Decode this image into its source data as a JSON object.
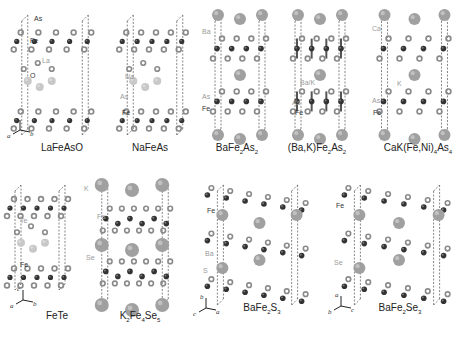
{
  "figure": {
    "colors": {
      "fe_atom": "#333333",
      "pnictogen_atom": "#8a8a8a",
      "large_cation": "#a0a0a0",
      "light_cation": "#c8c8c8",
      "cell_line": "#555555",
      "label_dark": "#333333",
      "label_light": "#9a9a9a"
    },
    "panels": [
      {
        "id": "lafeaso",
        "caption": "LaFeAsO",
        "caption_parts": [
          {
            "t": "LaFeAsO"
          }
        ],
        "element_labels": [
          "As",
          "Fe",
          "La",
          "O"
        ],
        "axes": {
          "c": "c",
          "a": "a",
          "b": "b"
        }
      },
      {
        "id": "nafeas",
        "caption": "NaFeAs",
        "caption_parts": [
          {
            "t": "NaFeAs"
          }
        ],
        "element_labels": [
          "Na",
          "As",
          "Fe"
        ]
      },
      {
        "id": "bafe2as2",
        "caption": "BaFe2As2",
        "caption_parts": [
          {
            "t": "BaFe"
          },
          {
            "sub": "2"
          },
          {
            "t": "As"
          },
          {
            "sub": "2"
          }
        ],
        "element_labels": [
          "Ba",
          "As",
          "Fe"
        ]
      },
      {
        "id": "bakfe2as2",
        "caption": "(Ba,K)Fe2As2",
        "caption_parts": [
          {
            "t": "(Ba,K)Fe"
          },
          {
            "sub": "2"
          },
          {
            "t": "As"
          },
          {
            "sub": "2"
          }
        ],
        "element_labels": [
          "Ba/K",
          "As",
          "Fe"
        ]
      },
      {
        "id": "cakfeni4as4",
        "caption": "CaK(Fe,Ni)4As4",
        "caption_parts": [
          {
            "t": "CaK(Fe,Ni)"
          },
          {
            "sub": "4"
          },
          {
            "t": "As"
          },
          {
            "sub": "4"
          }
        ],
        "element_labels": [
          "Ca",
          "K",
          "As",
          "Fe"
        ]
      },
      {
        "id": "fete",
        "caption": "FeTe",
        "caption_parts": [
          {
            "t": "FeTe"
          }
        ],
        "element_labels": [
          "Te",
          "Fe"
        ],
        "axes": {
          "c": "c",
          "a": "a",
          "b": "b"
        }
      },
      {
        "id": "k2fe4se5",
        "caption": "K2Fe4Se5",
        "caption_parts": [
          {
            "t": "K"
          },
          {
            "sub": "2"
          },
          {
            "t": "Fe"
          },
          {
            "sub": "4"
          },
          {
            "t": "Se"
          },
          {
            "sub": "5"
          }
        ],
        "element_labels": [
          "K",
          "Fe",
          "Se"
        ]
      },
      {
        "id": "bafe2s3",
        "caption": "BaFe2S3",
        "caption_parts": [
          {
            "t": "BaFe"
          },
          {
            "sub": "2"
          },
          {
            "t": "S"
          },
          {
            "sub": "3"
          }
        ],
        "element_labels": [
          "Fe",
          "Ba",
          "S"
        ],
        "axes": {
          "b": "b",
          "c": "c",
          "a": "a"
        }
      },
      {
        "id": "bafe2se3",
        "caption": "BaFe2Se3",
        "caption_parts": [
          {
            "t": "BaFe"
          },
          {
            "sub": "2"
          },
          {
            "t": "Se"
          },
          {
            "sub": "3"
          }
        ],
        "element_labels": [
          "Fe",
          "Se"
        ],
        "axes": {
          "a": "a",
          "b": "b",
          "c": "c"
        }
      }
    ]
  }
}
